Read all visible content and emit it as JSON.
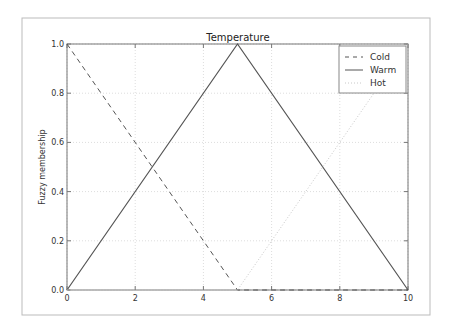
{
  "chart_data": {
    "type": "line",
    "title": "Temperature",
    "xlabel": "",
    "ylabel": "Fuzzy membership",
    "xlim": [
      0,
      10
    ],
    "ylim": [
      0.0,
      1.0
    ],
    "xticks": [
      "0",
      "2",
      "4",
      "6",
      "8",
      "10"
    ],
    "yticks": [
      "0.0",
      "0.2",
      "0.4",
      "0.6",
      "0.8",
      "1.0"
    ],
    "grid": true,
    "legend_position": "upper right",
    "series": [
      {
        "name": "Cold",
        "style": "dashed",
        "color": "#555555",
        "x": [
          0,
          5,
          10
        ],
        "values": [
          1.0,
          0.0,
          0.0
        ]
      },
      {
        "name": "Warm",
        "style": "solid",
        "color": "#555555",
        "x": [
          0,
          5,
          10
        ],
        "values": [
          0.0,
          1.0,
          0.0
        ]
      },
      {
        "name": "Hot",
        "style": "dotted",
        "color": "#c8c8c8",
        "x": [
          0,
          5,
          10
        ],
        "values": [
          0.0,
          0.0,
          1.0
        ]
      }
    ]
  },
  "legend": {
    "items": [
      "Cold",
      "Warm",
      "Hot"
    ]
  },
  "colors": {
    "frame": "#bbbbbb",
    "axes": "#777777",
    "grid": "#dddddd",
    "line_dark": "#555555",
    "line_light": "#c8c8c8"
  }
}
